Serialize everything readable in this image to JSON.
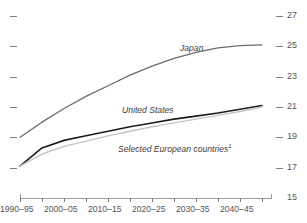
{
  "chart_data": {
    "type": "line",
    "title": "",
    "subtitle": "",
    "xlabel": "",
    "ylabel": "",
    "ylim": [
      15,
      27
    ],
    "y_ticks": [
      15,
      17,
      19,
      21,
      23,
      25,
      27
    ],
    "y_tick_labels": [
      "15",
      "17",
      "19",
      "21",
      "23",
      "25",
      "27"
    ],
    "y_axis_position": "right",
    "grid": false,
    "legend": "inline-labels",
    "x": [
      "1990–95",
      "1995–2000",
      "2000–05",
      "2005–10",
      "2010–15",
      "2015–20",
      "2020–25",
      "2025–30",
      "2030–35",
      "2035–40",
      "2040–45",
      "2045–50"
    ],
    "x_tick_labels": [
      "1990–95",
      "2000–05",
      "2010–15",
      "2020–25",
      "2030–35",
      "2040–45"
    ],
    "x_tick_label_indices": [
      0,
      2,
      4,
      6,
      8,
      10
    ],
    "series": [
      {
        "name": "Japan",
        "color": "#6b6b6b",
        "width": 1.3,
        "label_x": 180,
        "label_y": 44,
        "values": [
          19.0,
          20.0,
          20.9,
          21.7,
          22.4,
          23.1,
          23.7,
          24.2,
          24.6,
          24.9,
          25.05,
          25.1
        ]
      },
      {
        "name": "United States",
        "color": "#1c1c1c",
        "width": 1.6,
        "label_x": 122,
        "label_y": 106,
        "values": [
          17.1,
          18.3,
          18.8,
          19.1,
          19.4,
          19.7,
          19.95,
          20.2,
          20.4,
          20.6,
          20.85,
          21.1
        ]
      },
      {
        "name": "Selected European countries",
        "footnote_marker": "1",
        "color": "#c4c4c4",
        "width": 1.4,
        "label_x": 118,
        "label_y": 143,
        "values": [
          17.1,
          17.9,
          18.4,
          18.75,
          19.1,
          19.4,
          19.7,
          19.95,
          20.2,
          20.45,
          20.7,
          21.0
        ]
      }
    ],
    "axis_color": "#9a9a9a",
    "tick_color": "#7d7d7d",
    "left_unlabeled_ticks": [
      27,
      25,
      23,
      21,
      19,
      17
    ]
  }
}
